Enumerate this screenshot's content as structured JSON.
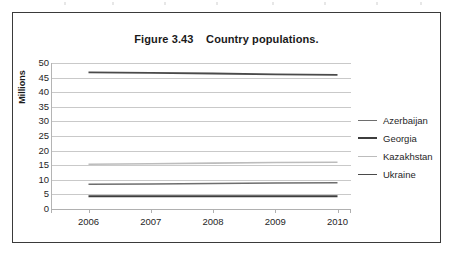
{
  "figure": {
    "title": "Figure 3.43    Country populations."
  },
  "chart_data": {
    "type": "line",
    "title": "Figure 3.43    Country populations.",
    "xlabel": "",
    "ylabel": "Millions",
    "x": [
      2006,
      2007,
      2008,
      2009,
      2010
    ],
    "xtick_labels": [
      "2006",
      "2007",
      "2008",
      "2009",
      "2010"
    ],
    "ytick_labels": [
      "0",
      "5",
      "10",
      "15",
      "20",
      "25",
      "30",
      "35",
      "40",
      "45",
      "50"
    ],
    "yticks": [
      0,
      5,
      10,
      15,
      20,
      25,
      30,
      35,
      40,
      45,
      50
    ],
    "ylim": [
      0,
      50
    ],
    "grid": true,
    "legend_position": "right",
    "series": [
      {
        "name": "Azerbaijan",
        "color": "#6e6e6e",
        "width": 1.5,
        "values": [
          8.5,
          8.6,
          8.7,
          8.9,
          9.0
        ]
      },
      {
        "name": "Georgia",
        "color": "#3d3d3d",
        "width": 2.0,
        "values": [
          4.4,
          4.4,
          4.4,
          4.4,
          4.4
        ]
      },
      {
        "name": "Kazakhstan",
        "color": "#bcbcbc",
        "width": 1.6,
        "values": [
          15.3,
          15.5,
          15.7,
          15.9,
          16.0
        ]
      },
      {
        "name": "Ukraine",
        "color": "#4a4a4a",
        "width": 1.8,
        "values": [
          46.8,
          46.6,
          46.4,
          46.1,
          45.9
        ]
      }
    ]
  }
}
